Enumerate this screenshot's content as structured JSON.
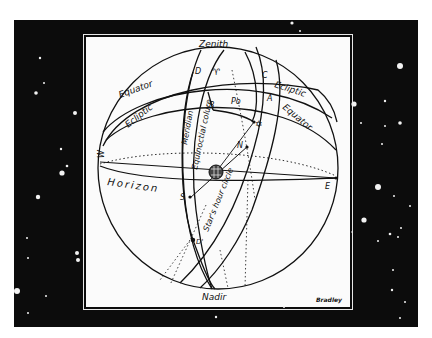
{
  "diagram": {
    "signature": "Bradley",
    "labels": {
      "zenith": "Zenith",
      "nadir": "Nadir",
      "equator_upper": "Equator",
      "equator_right": "Equator",
      "ecliptic_upper_right": "Ecliptic",
      "ecliptic_left": "Ecliptic",
      "horizon": "Horizon",
      "meridian": "Meridian",
      "equinoctial_colure": "Equinoctial colure",
      "hour_circle": "Star's hour circle",
      "point_d": "D",
      "point_aries": "♈",
      "point_c": "C",
      "point_a": "A",
      "point_b": "B",
      "point_po": "Po",
      "point_n": "N",
      "point_s": "S",
      "point_e": "E",
      "point_w": "W",
      "point_d_prime": "D'",
      "star_symbol": "✡"
    },
    "icons": {
      "star": "star-icon",
      "earth": "earth-globe-icon"
    },
    "colors": {
      "background_sky": "#0c0c0c",
      "panel": "#fbfbfb",
      "ink": "#111111"
    }
  },
  "stars": [
    {
      "x": 40,
      "y": 58,
      "r": 1.2
    },
    {
      "x": 44,
      "y": 83,
      "r": 1.0
    },
    {
      "x": 36,
      "y": 93,
      "r": 1.8
    },
    {
      "x": 75,
      "y": 113,
      "r": 2.0
    },
    {
      "x": 61,
      "y": 149,
      "r": 1.2
    },
    {
      "x": 67,
      "y": 166,
      "r": 1.3
    },
    {
      "x": 62,
      "y": 173,
      "r": 2.6
    },
    {
      "x": 38,
      "y": 197,
      "r": 2.2
    },
    {
      "x": 27,
      "y": 238,
      "r": 1.0
    },
    {
      "x": 28,
      "y": 258,
      "r": 1.0
    },
    {
      "x": 77,
      "y": 253,
      "r": 2.0
    },
    {
      "x": 78,
      "y": 260,
      "r": 2.0
    },
    {
      "x": 17,
      "y": 291,
      "r": 3.0
    },
    {
      "x": 46,
      "y": 296,
      "r": 1.0
    },
    {
      "x": 28,
      "y": 313,
      "r": 1.0
    },
    {
      "x": 292,
      "y": 23,
      "r": 1.6
    },
    {
      "x": 300,
      "y": 31,
      "r": 1.0
    },
    {
      "x": 216,
      "y": 317,
      "r": 1.2
    },
    {
      "x": 284,
      "y": 307,
      "r": 1.0
    },
    {
      "x": 400,
      "y": 66,
      "r": 3.0
    },
    {
      "x": 354,
      "y": 104,
      "r": 2.6
    },
    {
      "x": 385,
      "y": 101,
      "r": 1.2
    },
    {
      "x": 361,
      "y": 123,
      "r": 1.0
    },
    {
      "x": 385,
      "y": 126,
      "r": 1.0
    },
    {
      "x": 400,
      "y": 123,
      "r": 1.8
    },
    {
      "x": 382,
      "y": 144,
      "r": 1.0
    },
    {
      "x": 378,
      "y": 187,
      "r": 3.0
    },
    {
      "x": 394,
      "y": 196,
      "r": 1.0
    },
    {
      "x": 410,
      "y": 206,
      "r": 1.0
    },
    {
      "x": 364,
      "y": 220,
      "r": 2.6
    },
    {
      "x": 401,
      "y": 228,
      "r": 1.0
    },
    {
      "x": 390,
      "y": 234,
      "r": 1.3
    },
    {
      "x": 398,
      "y": 237,
      "r": 1.0
    },
    {
      "x": 378,
      "y": 241,
      "r": 1.0
    },
    {
      "x": 393,
      "y": 270,
      "r": 1.0
    },
    {
      "x": 392,
      "y": 290,
      "r": 1.2
    },
    {
      "x": 405,
      "y": 302,
      "r": 1.0
    },
    {
      "x": 400,
      "y": 318,
      "r": 1.0
    },
    {
      "x": 352,
      "y": 232,
      "r": 0.8
    }
  ]
}
